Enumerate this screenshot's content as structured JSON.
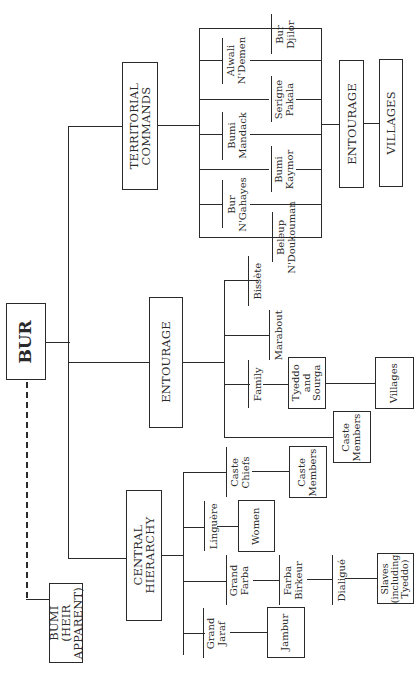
{
  "diagram": {
    "type": "organizational-chart",
    "orientation": "rotated-90-ccw",
    "root": {
      "label": "BUR"
    },
    "heir": {
      "label": "BUMI\n(HEIR\nAPPARENT)",
      "link": "dashed"
    },
    "branches": {
      "territorial": {
        "label": "TERRITORIAL\nCOMMANDS",
        "commands": [
          {
            "label": "Bur\nDjilor"
          },
          {
            "label": "Alwali\nN'Demen"
          },
          {
            "label": "Serigne\nPakala"
          },
          {
            "label": "Bumi\nMandack"
          },
          {
            "label": "Bumi\nKaymor"
          },
          {
            "label": "Bur\nN'Gahayes"
          },
          {
            "label": "Beleup\nN'Doukouman"
          }
        ],
        "entourage": {
          "label": "ENTOURAGE"
        },
        "villages": {
          "label": "VILLAGES"
        }
      },
      "entourage": {
        "label": "ENTOURAGE",
        "members": [
          {
            "label": "Bissète"
          },
          {
            "label": "Marabout"
          },
          {
            "label": "Family"
          }
        ],
        "tyeddo": {
          "label": "Tyeddo\nand\nSourga"
        },
        "villages": {
          "label": "Villages"
        },
        "caste_members": {
          "label": "Caste\nMembers"
        }
      },
      "central": {
        "label": "CENTRAL\nHIERARCHY",
        "caste_chiefs": {
          "label": "Caste\nChiefs"
        },
        "caste_members": {
          "label": "Caste\nMembers"
        },
        "linguere": {
          "label": "Linguère"
        },
        "women": {
          "label": "Women"
        },
        "grand_farba": {
          "label": "Grand\nFarba"
        },
        "farba_birkeur": {
          "label": "Farba\nBirkeur"
        },
        "dialigue": {
          "label": "Dialigué"
        },
        "slaves": {
          "label": "Slaves\n(including\nTyeddo)"
        },
        "grand_jaraf": {
          "label": "Grand\nJaraf"
        },
        "jambur": {
          "label": "Jambur"
        }
      }
    }
  }
}
